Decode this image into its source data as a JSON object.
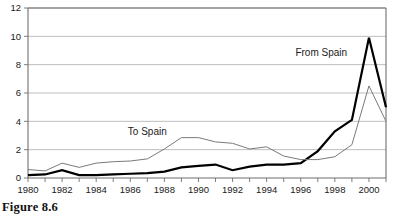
{
  "caption": "Figure 8.6",
  "chart_data": {
    "type": "line",
    "title": "",
    "xlabel": "",
    "ylabel": "",
    "xlim": [
      1980,
      2001
    ],
    "ylim": [
      0,
      12
    ],
    "yticks": [
      0,
      2,
      4,
      6,
      8,
      10,
      12
    ],
    "xticks": [
      1980,
      1982,
      1984,
      1986,
      1988,
      1990,
      1992,
      1994,
      1996,
      1998,
      2000
    ],
    "x_minor_ticks_every": 1,
    "grid": "horizontal",
    "legend": "inline-annotations",
    "x": [
      1980,
      1981,
      1982,
      1983,
      1984,
      1985,
      1986,
      1987,
      1988,
      1989,
      1990,
      1991,
      1992,
      1993,
      1994,
      1995,
      1996,
      1997,
      1998,
      1999,
      2000,
      2001
    ],
    "series": [
      {
        "name": "From Spain",
        "style": "bold",
        "color": "#000000",
        "width": 2.2,
        "label_x": 1997.2,
        "label_y": 8.6,
        "values": [
          0.2,
          0.25,
          0.55,
          0.2,
          0.2,
          0.25,
          0.3,
          0.35,
          0.45,
          0.75,
          0.85,
          0.95,
          0.55,
          0.8,
          0.95,
          0.95,
          1.05,
          1.9,
          3.3,
          4.1,
          9.9,
          5.0
        ]
      },
      {
        "name": "To Spain",
        "style": "thin",
        "color": "#7a7a7a",
        "width": 1.0,
        "label_x": 1987.0,
        "label_y": 3.05,
        "values": [
          0.6,
          0.5,
          1.05,
          0.75,
          1.05,
          1.15,
          1.2,
          1.35,
          2.05,
          2.85,
          2.85,
          2.55,
          2.45,
          2.05,
          2.2,
          1.55,
          1.3,
          1.3,
          1.5,
          2.35,
          6.5,
          4.0
        ]
      }
    ],
    "ytick_labels": [
      "0",
      "2",
      "4",
      "6",
      "8",
      "10",
      "12"
    ],
    "xtick_labels": [
      "1980",
      "1982",
      "1984",
      "1986",
      "1988",
      "1990",
      "1992",
      "1994",
      "1996",
      "1998",
      "2000"
    ],
    "axis_color": "#6f6f6f",
    "grid_color": "#b5b5b5",
    "frame_color": "#6f6f6f"
  }
}
